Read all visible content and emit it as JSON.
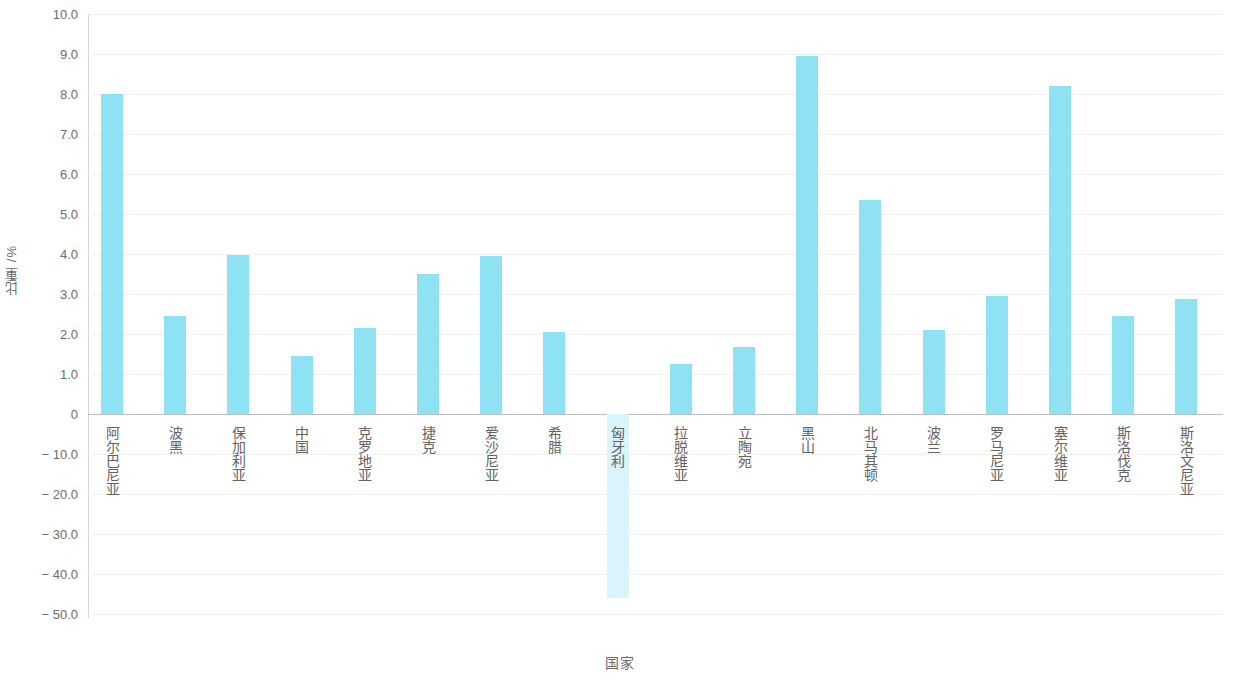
{
  "chart_data": {
    "type": "bar",
    "title": "",
    "xlabel": "国家",
    "ylabel": "比重 /%",
    "categories": [
      "阿尔巴尼亚",
      "波黑",
      "保加利亚",
      "中国",
      "克罗地亚",
      "捷克",
      "爱沙尼亚",
      "希腊",
      "匈牙利",
      "拉脱维亚",
      "立陶宛",
      "黑山",
      "北马其顿",
      "波兰",
      "罗马尼亚",
      "塞尔维亚",
      "斯洛伐克",
      "斯洛文尼亚"
    ],
    "values": [
      8.0,
      2.45,
      3.98,
      1.45,
      2.15,
      3.5,
      3.95,
      2.05,
      -46.0,
      1.25,
      1.68,
      8.95,
      5.35,
      2.1,
      2.95,
      8.2,
      2.45,
      2.88
    ],
    "series": [
      {
        "name": "比重",
        "values": [
          8.0,
          2.45,
          3.98,
          1.45,
          2.15,
          3.5,
          3.95,
          2.05,
          -46.0,
          1.25,
          1.68,
          8.95,
          5.35,
          2.1,
          2.95,
          8.2,
          2.45,
          2.88
        ]
      }
    ],
    "y_ticks_positive": [
      "10.0",
      "9.0",
      "8.0",
      "7.0",
      "6.0",
      "5.0",
      "4.0",
      "3.0",
      "2.0",
      "1.0",
      "0"
    ],
    "y_ticks_negative": [
      "− 10.0",
      "− 20.0",
      "− 30.0",
      "− 40.0",
      "− 50.0"
    ],
    "y_tick_values_positive": [
      10.0,
      9.0,
      8.0,
      7.0,
      6.0,
      5.0,
      4.0,
      3.0,
      2.0,
      1.0,
      0
    ],
    "y_tick_values_negative": [
      -10.0,
      -20.0,
      -30.0,
      -40.0,
      -50.0
    ],
    "ylim": [
      -50.0,
      10.0
    ],
    "axis_note": "broken y-axis: 1.0 steps above zero, 10.0 steps below zero",
    "grid": true,
    "legend": "none",
    "bar_color": "#8ee2f3",
    "bar_color_negative": "#d9f4fc",
    "gridline_color": "#f0f0f0",
    "zero_line_color": "#bdbdbd",
    "axis_line_color": "#d6d6d6",
    "text_color": "#6a6a6a"
  }
}
